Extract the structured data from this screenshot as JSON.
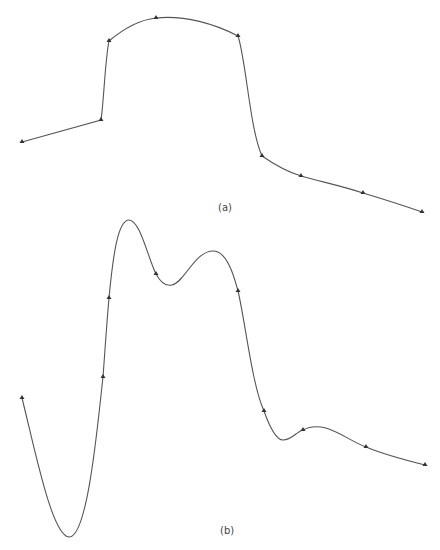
{
  "panels": [
    {
      "id": "a",
      "caption": "(a)",
      "description": "Shape-preserving (monotone) interpolant through data points",
      "nodes": [
        [
          22,
          142
        ],
        [
          101,
          120
        ],
        [
          109,
          41
        ],
        [
          156,
          18
        ],
        [
          238,
          36
        ],
        [
          262,
          156
        ],
        [
          301,
          176
        ],
        [
          363,
          193
        ],
        [
          422,
          212
        ]
      ]
    },
    {
      "id": "b",
      "caption": "(b)",
      "description": "Cubic spline interpolant through same data points showing oscillation",
      "nodes": [
        [
          22,
          398
        ],
        [
          103,
          377
        ],
        [
          109,
          298
        ],
        [
          156,
          274
        ],
        [
          238,
          291
        ],
        [
          264,
          411
        ],
        [
          303,
          430
        ],
        [
          366,
          447
        ],
        [
          425,
          465
        ]
      ]
    }
  ],
  "colors": {
    "curve": "#555555",
    "node": "#333333",
    "background": "#ffffff"
  }
}
